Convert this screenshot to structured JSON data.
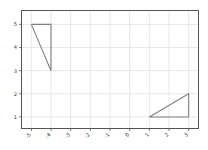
{
  "chart_data": {
    "type": "line",
    "title": "",
    "xlabel": "",
    "ylabel": "",
    "xlim": [
      -5.5,
      3.5
    ],
    "ylim": [
      0.5,
      5.6
    ],
    "grid": true,
    "legend": null,
    "xticks": [
      -5,
      -4,
      -3,
      -2,
      -1,
      0,
      1,
      2,
      3
    ],
    "xticklabels": [
      "-5",
      "-4",
      "-3",
      "-2",
      "-1",
      "0",
      "1",
      "2",
      "3"
    ],
    "xtick_rotation": -45,
    "yticks": [
      1,
      2,
      3,
      4,
      5
    ],
    "yticklabels": [
      "1",
      "2",
      "3",
      "4",
      "5"
    ],
    "series": [
      {
        "name": "triangle-1",
        "shape": "triangle",
        "closed": true,
        "color": "#808080",
        "x": [
          -5,
          -4,
          -4,
          -5
        ],
        "y": [
          5,
          5,
          3,
          5
        ],
        "vertices": [
          [
            -5,
            5
          ],
          [
            -4,
            5
          ],
          [
            -4,
            3
          ]
        ]
      },
      {
        "name": "triangle-2",
        "shape": "triangle",
        "closed": true,
        "color": "#808080",
        "x": [
          1,
          3,
          3,
          1
        ],
        "y": [
          1,
          1,
          2,
          1
        ],
        "vertices": [
          [
            1,
            1
          ],
          [
            3,
            1
          ],
          [
            3,
            2
          ]
        ]
      }
    ],
    "colors": {
      "line": "#808080",
      "grid": "#e8e8e8",
      "axes_frame": "#555555",
      "tick_label": "#3a3a3a",
      "background": "#ffffff"
    }
  },
  "axes": {
    "frame_label": "plot-frame",
    "grid_label": "grid-lines"
  }
}
